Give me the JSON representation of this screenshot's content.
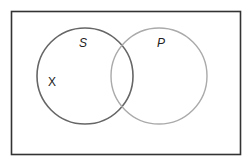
{
  "diagram": {
    "type": "venn",
    "frame": {
      "x": 11.5,
      "y": 11.5,
      "width": 229,
      "height": 143,
      "stroke": "#333333"
    },
    "sets": [
      {
        "id": "S",
        "label": "S",
        "cx": 85,
        "cy": 76,
        "r": 48,
        "stroke": "#666666",
        "label_x": 83,
        "label_y": 47
      },
      {
        "id": "P",
        "label": "P",
        "cx": 159,
        "cy": 76,
        "r": 48,
        "stroke": "#aaaaaa",
        "label_x": 161,
        "label_y": 47
      }
    ],
    "elements": [
      {
        "label": "X",
        "region": "S only",
        "x": 52,
        "y": 86
      }
    ]
  }
}
